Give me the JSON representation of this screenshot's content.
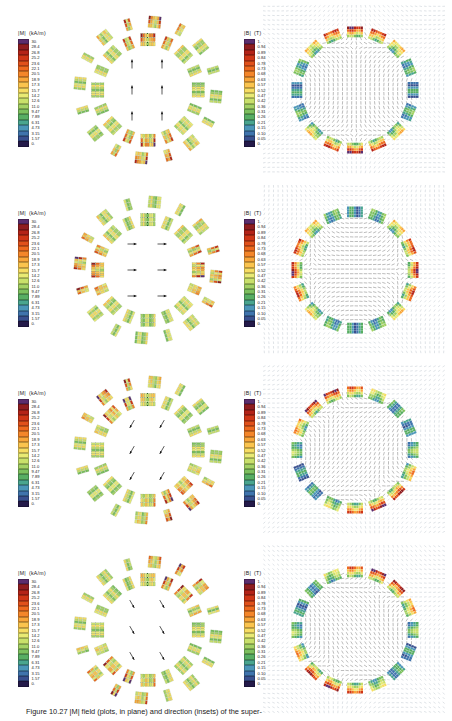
{
  "figure": {
    "caption": "Figure 10.27  |M| field  (plots, in plane) and direction (insets) of the super-",
    "rows": [
      {
        "id": "row-1",
        "field_angle_deg": 90,
        "arrow_label": "vertical-up",
        "left": {
          "title_symbol": "|M|",
          "title_unit": "(kA/m)"
        },
        "right": {
          "title_symbol": "|B|",
          "title_unit": "(T)"
        }
      },
      {
        "id": "row-2",
        "field_angle_deg": 0,
        "arrow_label": "horizontal-left",
        "left": {
          "title_symbol": "|M|",
          "title_unit": "(kA/m)"
        },
        "right": {
          "title_symbol": "|B|",
          "title_unit": "(T)"
        }
      },
      {
        "id": "row-3",
        "field_angle_deg": 240,
        "arrow_label": "diagonal-down-left",
        "left": {
          "title_symbol": "|M|",
          "title_unit": "(kA/m)"
        },
        "right": {
          "title_symbol": "|B|",
          "title_unit": "(T)"
        }
      },
      {
        "id": "row-4",
        "field_angle_deg": 300,
        "arrow_label": "diagonal-down-right",
        "left": {
          "title_symbol": "|M|",
          "title_unit": "(kA/m)"
        },
        "right": {
          "title_symbol": "|B|",
          "title_unit": "(T)"
        }
      }
    ]
  },
  "chart_data": [
    {
      "type": "heatmap",
      "name": "magnetisation-colorbar",
      "title": "|M|",
      "units": "kA/m",
      "ylabel": "|M| (kA/m)",
      "legend_position": "left",
      "grid": false,
      "ylim": [
        0,
        30
      ],
      "tick_labels": [
        "30.",
        "28.4",
        "26.8",
        "25.2",
        "23.6",
        "22.1",
        "20.5",
        "18.9",
        "17.3",
        "15.7",
        "14.2",
        "12.6",
        "11.0",
        "9.47",
        "7.89",
        "6.31",
        "4.73",
        "3.15",
        "1.57",
        "0."
      ],
      "values": [
        30.0,
        28.4,
        26.8,
        25.2,
        23.6,
        22.1,
        20.5,
        18.9,
        17.3,
        15.7,
        14.2,
        12.6,
        11.0,
        9.47,
        7.89,
        6.31,
        4.73,
        3.15,
        1.57,
        0.0
      ],
      "colors": [
        "#5b2d6e",
        "#8f1d20",
        "#b42318",
        "#cf3617",
        "#e1511b",
        "#ee6a1f",
        "#f4862a",
        "#f9a63a",
        "#fbc44e",
        "#f7dd63",
        "#e9ea74",
        "#c9e06b",
        "#a3d164",
        "#7cc05e",
        "#57ae63",
        "#49a58f",
        "#4b96b8",
        "#3f74ad",
        "#39508f",
        "#241a4a"
      ]
    },
    {
      "type": "heatmap",
      "name": "flux-density-colorbar",
      "title": "|B|",
      "units": "T",
      "ylabel": "|B| (T)",
      "legend_position": "left",
      "grid": false,
      "ylim": [
        0,
        1.0
      ],
      "tick_labels": [
        "1.",
        "0.94",
        "0.89",
        "0.84",
        "0.78",
        "0.73",
        "0.68",
        "0.63",
        "0.57",
        "0.52",
        "0.47",
        "0.42",
        "0.36",
        "0.31",
        "0.26",
        "0.21",
        "0.15",
        "0.10",
        "0.05",
        "0."
      ],
      "values": [
        1.0,
        0.94,
        0.89,
        0.84,
        0.78,
        0.73,
        0.68,
        0.63,
        0.57,
        0.52,
        0.47,
        0.42,
        0.36,
        0.31,
        0.26,
        0.21,
        0.15,
        0.1,
        0.05,
        0.0
      ],
      "colors": [
        "#5b2d6e",
        "#8f1d20",
        "#b42318",
        "#cf3617",
        "#e1511b",
        "#ee6a1f",
        "#f4862a",
        "#f9a63a",
        "#fbc44e",
        "#f7dd63",
        "#e9ea74",
        "#c9e06b",
        "#a3d164",
        "#7cc05e",
        "#57ae63",
        "#49a58f",
        "#4b96b8",
        "#3f74ad",
        "#39508f",
        "#241a4a"
      ]
    }
  ]
}
